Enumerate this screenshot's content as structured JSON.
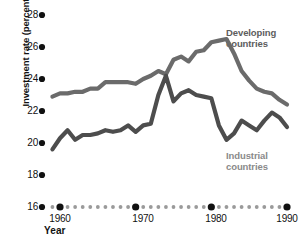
{
  "chart_data": {
    "type": "line",
    "title": "",
    "xlabel": "Year",
    "ylabel": "Investment rate (percentage of GDP)",
    "xlim": [
      1959,
      1990
    ],
    "ylim": [
      16,
      28
    ],
    "yticks": [
      28,
      26,
      24,
      22,
      20,
      18,
      16
    ],
    "xticks": [
      1960,
      1970,
      1980,
      1990
    ],
    "grid": false,
    "legend_position": "inline-annotation",
    "x": [
      1959,
      1960,
      1961,
      1962,
      1963,
      1964,
      1965,
      1966,
      1967,
      1968,
      1969,
      1970,
      1971,
      1972,
      1973,
      1974,
      1975,
      1976,
      1977,
      1978,
      1979,
      1980,
      1981,
      1982,
      1983,
      1984,
      1985,
      1986,
      1987,
      1988,
      1989,
      1990
    ],
    "series": [
      {
        "name": "Developing countries",
        "color": "#6b6b6b",
        "values": [
          22.9,
          23.1,
          23.1,
          23.2,
          23.2,
          23.4,
          23.4,
          23.8,
          23.8,
          23.8,
          23.8,
          23.7,
          24.0,
          24.2,
          24.5,
          24.3,
          25.2,
          25.4,
          25.1,
          25.7,
          25.8,
          26.3,
          26.4,
          26.5,
          25.6,
          24.5,
          23.9,
          23.4,
          23.2,
          23.1,
          22.7,
          22.4
        ]
      },
      {
        "name": "Industrial countries",
        "color": "#4d4d4d",
        "values": [
          19.6,
          20.3,
          20.8,
          20.2,
          20.5,
          20.5,
          20.6,
          20.8,
          20.7,
          20.8,
          21.1,
          20.7,
          21.1,
          21.2,
          23.0,
          24.2,
          22.6,
          23.1,
          23.3,
          23.0,
          22.9,
          22.8,
          21.1,
          20.2,
          20.6,
          21.4,
          21.1,
          20.8,
          21.4,
          21.9,
          21.6,
          21.0
        ]
      }
    ],
    "annotations": [
      {
        "text_line1": "Developing",
        "text_line2": "countries",
        "x_px": 226,
        "y_px": 27
      },
      {
        "text_line1": "Industrial",
        "text_line2": "countries",
        "x_px": 226,
        "y_px": 150
      }
    ]
  },
  "axis": {
    "ytick_labels": [
      "28",
      "26",
      "24",
      "22",
      "20",
      "18",
      "16"
    ],
    "xtick_labels": [
      "1960",
      "1970",
      "1980",
      "1990"
    ],
    "x_axis_title": "Year",
    "y_axis_title": "Investment rate (percentage of GDP)"
  },
  "colors": {
    "background": "#ffffff",
    "text": "#111111",
    "developing_line": "#6b6b6b",
    "industrial_line": "#4d4d4d",
    "tick_dot": "#111111",
    "minor_dot": "#9a9a9a"
  }
}
